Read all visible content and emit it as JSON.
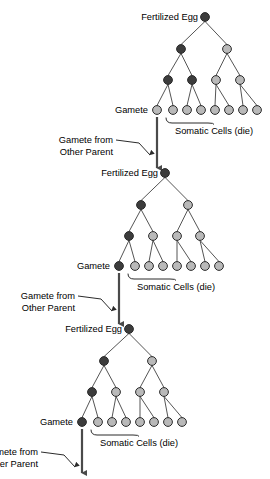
{
  "diagram": {
    "colors": {
      "germline_dark": "#3c3c3c",
      "somatic_light": "#b9b9b9",
      "outline": "#2b2b2b",
      "line": "#555555",
      "background": "#ffffff",
      "text": "#000000"
    },
    "labels": {
      "fertilized_egg": "Fertilized Egg",
      "gamete": "Gamete",
      "somatic_cells": "Somatic Cells (die)",
      "gamete_from_other_parent_line1": "Gamete from",
      "gamete_from_other_parent_line2": "Other Parent"
    },
    "generations": [
      {
        "id": "generation-1",
        "root": {
          "x": 205,
          "y": 17,
          "type": "germline"
        },
        "level2": [
          {
            "x": 181,
            "y": 49,
            "type": "germline"
          },
          {
            "x": 227,
            "y": 49,
            "type": "somatic"
          }
        ],
        "level3": [
          {
            "x": 168,
            "y": 80,
            "type": "germline"
          },
          {
            "x": 192,
            "y": 80,
            "type": "germline"
          },
          {
            "x": 216,
            "y": 80,
            "type": "somatic"
          },
          {
            "x": 240,
            "y": 80,
            "type": "somatic"
          }
        ],
        "leaves": [
          {
            "x": 157,
            "y": 110,
            "type": "somatic",
            "role": "gamete"
          },
          {
            "x": 173,
            "y": 110,
            "type": "somatic",
            "role": "somatic"
          },
          {
            "x": 187,
            "y": 110,
            "type": "somatic",
            "role": "somatic"
          },
          {
            "x": 201,
            "y": 110,
            "type": "somatic",
            "role": "somatic"
          },
          {
            "x": 215,
            "y": 110,
            "type": "somatic",
            "role": "somatic"
          },
          {
            "x": 229,
            "y": 110,
            "type": "somatic",
            "role": "somatic"
          },
          {
            "x": 243,
            "y": 110,
            "type": "somatic",
            "role": "somatic"
          },
          {
            "x": 257,
            "y": 110,
            "type": "somatic",
            "role": "somatic"
          }
        ],
        "gamete_label_pos": {
          "x": 148,
          "y": 113
        },
        "egg_label_pos": {
          "x": 198,
          "y": 20
        },
        "bracket": {
          "x1": 166,
          "x2": 262,
          "y": 118,
          "tip_x": 214,
          "tip_y": 124
        },
        "somatic_label_pos": {
          "x": 214,
          "y": 134
        },
        "descent_arrow": {
          "x": 157,
          "y_from": 117,
          "y_to": 168
        },
        "other_parent_label": {
          "x": 113,
          "y1": 143,
          "y2": 155
        },
        "other_parent_leader": {
          "x1": 116,
          "y1": 140,
          "x2": 150,
          "y2": 155
        }
      },
      {
        "id": "generation-2",
        "root": {
          "x": 165,
          "y": 173,
          "type": "germline"
        },
        "level2": [
          {
            "x": 141,
            "y": 205,
            "type": "germline"
          },
          {
            "x": 188,
            "y": 205,
            "type": "somatic"
          }
        ],
        "level3": [
          {
            "x": 129,
            "y": 236,
            "type": "germline"
          },
          {
            "x": 153,
            "y": 236,
            "type": "somatic"
          },
          {
            "x": 177,
            "y": 236,
            "type": "somatic"
          },
          {
            "x": 200,
            "y": 236,
            "type": "somatic"
          }
        ],
        "leaves": [
          {
            "x": 119,
            "y": 266,
            "type": "germline",
            "role": "gamete"
          },
          {
            "x": 135,
            "y": 266,
            "type": "somatic",
            "role": "somatic"
          },
          {
            "x": 149,
            "y": 266,
            "type": "somatic",
            "role": "somatic"
          },
          {
            "x": 163,
            "y": 266,
            "type": "somatic",
            "role": "somatic"
          },
          {
            "x": 177,
            "y": 266,
            "type": "somatic",
            "role": "somatic"
          },
          {
            "x": 191,
            "y": 266,
            "type": "somatic",
            "role": "somatic"
          },
          {
            "x": 205,
            "y": 266,
            "type": "somatic",
            "role": "somatic"
          },
          {
            "x": 219,
            "y": 266,
            "type": "somatic",
            "role": "somatic"
          }
        ],
        "gamete_label_pos": {
          "x": 110,
          "y": 269
        },
        "egg_label_pos": {
          "x": 158,
          "y": 176
        },
        "bracket": {
          "x1": 128,
          "x2": 224,
          "y": 274,
          "tip_x": 176,
          "tip_y": 280
        },
        "somatic_label_pos": {
          "x": 176,
          "y": 290
        },
        "descent_arrow": {
          "x": 119,
          "y_from": 273,
          "y_to": 324
        },
        "other_parent_label": {
          "x": 75,
          "y1": 299,
          "y2": 311
        },
        "other_parent_leader": {
          "x1": 78,
          "y1": 296,
          "x2": 112,
          "y2": 311
        }
      },
      {
        "id": "generation-3",
        "root": {
          "x": 129,
          "y": 329,
          "type": "germline"
        },
        "level2": [
          {
            "x": 104,
            "y": 361,
            "type": "germline"
          },
          {
            "x": 152,
            "y": 361,
            "type": "somatic"
          }
        ],
        "level3": [
          {
            "x": 92,
            "y": 392,
            "type": "germline"
          },
          {
            "x": 116,
            "y": 392,
            "type": "somatic"
          },
          {
            "x": 140,
            "y": 392,
            "type": "somatic"
          },
          {
            "x": 164,
            "y": 392,
            "type": "somatic"
          }
        ],
        "leaves": [
          {
            "x": 82,
            "y": 422,
            "type": "germline",
            "role": "gamete"
          },
          {
            "x": 98,
            "y": 422,
            "type": "somatic",
            "role": "somatic"
          },
          {
            "x": 112,
            "y": 422,
            "type": "somatic",
            "role": "somatic"
          },
          {
            "x": 126,
            "y": 422,
            "type": "somatic",
            "role": "somatic"
          },
          {
            "x": 140,
            "y": 422,
            "type": "somatic",
            "role": "somatic"
          },
          {
            "x": 154,
            "y": 422,
            "type": "somatic",
            "role": "somatic"
          },
          {
            "x": 168,
            "y": 422,
            "type": "somatic",
            "role": "somatic"
          },
          {
            "x": 182,
            "y": 422,
            "type": "somatic",
            "role": "somatic"
          }
        ],
        "gamete_label_pos": {
          "x": 73,
          "y": 425
        },
        "egg_label_pos": {
          "x": 122,
          "y": 332
        },
        "bracket": {
          "x1": 91,
          "x2": 187,
          "y": 430,
          "tip_x": 139,
          "tip_y": 436
        },
        "somatic_label_pos": {
          "x": 139,
          "y": 446
        },
        "descent_arrow": {
          "x": 82,
          "y_from": 429,
          "y_to": 473
        },
        "other_parent_label": {
          "x": 38,
          "y1": 455,
          "y2": 467
        },
        "other_parent_leader": {
          "x1": 41,
          "y1": 452,
          "x2": 75,
          "y2": 467
        }
      }
    ]
  }
}
